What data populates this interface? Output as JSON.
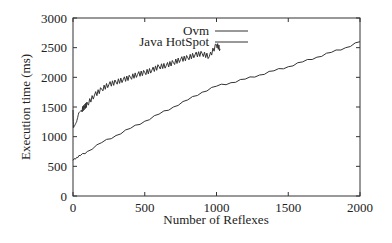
{
  "chart_data": {
    "type": "line",
    "title": "",
    "xlabel": "Number of Reflexes",
    "ylabel": "Execution time (ms)",
    "xlim": [
      0,
      2000
    ],
    "ylim": [
      0,
      3000
    ],
    "xticks": [
      0,
      500,
      1000,
      1500,
      2000
    ],
    "yticks": [
      0,
      500,
      1000,
      1500,
      2000,
      2500,
      3000
    ],
    "grid": false,
    "legend_position": "top-inside",
    "series": [
      {
        "name": "Ovm",
        "x": [
          0,
          25,
          50,
          100,
          200,
          300,
          400,
          500,
          600,
          700,
          800,
          900,
          1000,
          1100,
          1200,
          1300,
          1400,
          1500,
          1600,
          1700,
          1800,
          1900,
          2000
        ],
        "y": [
          600,
          650,
          680,
          750,
          900,
          1020,
          1140,
          1260,
          1380,
          1500,
          1620,
          1750,
          1850,
          1910,
          1970,
          2040,
          2110,
          2180,
          2260,
          2340,
          2420,
          2500,
          2600
        ]
      },
      {
        "name": "Java HotSpot",
        "x": [
          0,
          3,
          10,
          25,
          40,
          60,
          80,
          100,
          150,
          200,
          250,
          300,
          350,
          400,
          450,
          500,
          550,
          600,
          650,
          700,
          750,
          800,
          850,
          900,
          950,
          1000,
          1025
        ],
        "y": [
          1450,
          1150,
          1180,
          1250,
          1400,
          1450,
          1500,
          1550,
          1700,
          1800,
          1880,
          1920,
          1960,
          2000,
          2050,
          2080,
          2120,
          2180,
          2200,
          2250,
          2300,
          2330,
          2380,
          2400,
          2350,
          2550,
          2480
        ]
      }
    ]
  },
  "labels": {
    "xlabel": "Number of Reflexes",
    "ylabel": "Execution time (ms)",
    "legend": [
      "Ovm",
      "Java HotSpot"
    ]
  }
}
